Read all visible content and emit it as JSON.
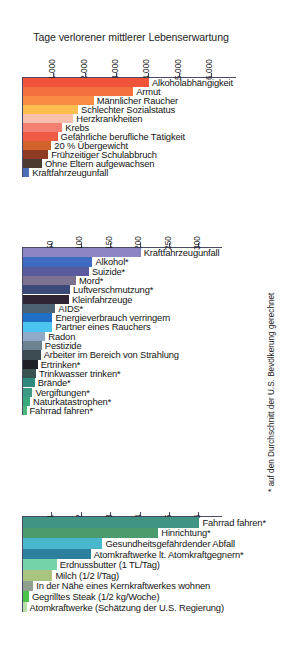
{
  "figure": {
    "title": "Tage verlorener mittlerer Lebenserwartung",
    "footnote": "* auf den Durchschnitt der U.S. Bevölkerung gerechnet"
  },
  "chart_data": [
    {
      "type": "bar",
      "orientation": "horizontal",
      "title": "Tage verlorener mittlerer Lebenserwartung",
      "xlabel": "",
      "ylabel": "",
      "xlim": [
        0,
        6800
      ],
      "axis_position": "top",
      "grid": false,
      "legend": null,
      "ticks": [
        1000,
        2000,
        3000,
        4000,
        5000,
        6000
      ],
      "ticklabels": [
        "1.000",
        "2.000",
        "3.000",
        "4.000",
        "5.000",
        "6.000"
      ],
      "categories": [
        "Alkoholabhängigkeit",
        "Armut",
        "Männlicher Raucher",
        "Schlechter Sozialstatus",
        "Herzkrankheiten",
        "Krebs",
        "Gefährliche berufliche Tätigkeit",
        "20 % Übergewicht",
        "Frühzeitiger Schulabbruch",
        "Ohne Eltern aufgewachsen",
        "Kraftfahrzeugunfall"
      ],
      "values": [
        4000,
        3500,
        2250,
        1750,
        1600,
        1250,
        1100,
        900,
        800,
        600,
        200
      ],
      "colors": [
        "#f0543a",
        "#f4713f",
        "#f98c45",
        "#fcbe4e",
        "#f9c0ae",
        "#f48073",
        "#ef5b45",
        "#d2622b",
        "#8f3a22",
        "#4a3a30",
        "#4a6fb5"
      ]
    },
    {
      "type": "bar",
      "orientation": "horizontal",
      "title": "",
      "xlabel": "",
      "ylabel": "",
      "xlim": [
        0,
        340
      ],
      "axis_position": "top",
      "grid": false,
      "legend": null,
      "ticks": [
        50,
        100,
        150,
        200,
        250,
        300
      ],
      "ticklabels": [
        "50",
        "100",
        "150",
        "200",
        "250",
        "300"
      ],
      "categories": [
        "Kraftfahrzeugunfall",
        "Alkohol*",
        "Suizide*",
        "Mord*",
        "Luftverschmutzung*",
        "Kleinfahrzeuge",
        "AIDS*",
        "Energieverbrauch verringern",
        "Partner eines Rauchers",
        "Radon",
        "Pestizide",
        "Arbeiter im Bereich von Strahlung",
        "Ertrinken*",
        "Trinkwasser trinken*",
        "Brände*",
        "Vergiftungen*",
        "Naturkatastrophen*",
        "Fahrrad fahren*"
      ],
      "values": [
        200,
        118,
        112,
        90,
        80,
        78,
        55,
        50,
        50,
        38,
        32,
        30,
        25,
        22,
        20,
        16,
        12,
        6
      ],
      "colors": [
        "#8c86c4",
        "#3f6cc0",
        "#5a5a9e",
        "#7d7391",
        "#3b4a78",
        "#2e2433",
        "#4c6374",
        "#1f6fc4",
        "#4cc4f2",
        "#91aac7",
        "#6d8391",
        "#3c4c52",
        "#1d2026",
        "#39514f",
        "#2d8a7d",
        "#3b9a86",
        "#39a87c",
        "#4bb87e"
      ]
    },
    {
      "type": "bar",
      "orientation": "horizontal",
      "title": "",
      "xlabel": "",
      "ylabel": "",
      "xlim": [
        0,
        6.8
      ],
      "axis_position": "top",
      "grid": false,
      "legend": null,
      "ticks": [
        1,
        2,
        3,
        4,
        5,
        6
      ],
      "ticklabels": [
        "1",
        "2",
        "3",
        "4",
        "5",
        "6"
      ],
      "categories": [
        "Fahrrad fahren*",
        "Hinrichtung*",
        "Gesundheitsgefährdender Abfall",
        "Atomkraftwerke lt. Atomkraftgegnern*",
        "Erdnussbutter (1 TL/Tag)",
        "Milch (1/2 l/Tag)",
        "In der Nähe eines Kernkraftwerkes wohnen",
        "Gegrilltes Steak (1/2 kg/Woche)",
        "Atomkraftwerke (Schätzung der U.S. Regierung)"
      ],
      "values": [
        6.0,
        4.6,
        2.7,
        2.3,
        1.15,
        1.0,
        0.35,
        0.2,
        0.12
      ],
      "colors": [
        "#3f9484",
        "#4c9b6f",
        "#49b8cf",
        "#2d7f9e",
        "#75d3a8",
        "#a8c47e",
        "#8fa091",
        "#4cc44c",
        "#b8e0a8"
      ]
    }
  ]
}
